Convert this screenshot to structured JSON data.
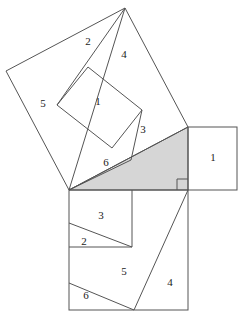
{
  "figure": {
    "kind": "pythagorean-dissection",
    "caption": "",
    "canvas": {
      "width": 249,
      "height": 322
    },
    "colors": {
      "stroke": "#555555",
      "triangle_fill": "#d6d6d6",
      "background": "#ffffff",
      "label_text": "#222222"
    },
    "triangle": {
      "name": "right-triangle",
      "vertices": {
        "left": [
          69,
          190
        ],
        "right_angle": [
          188,
          190
        ],
        "top": [
          188,
          127
        ]
      },
      "legs": {
        "horizontal": 119,
        "vertical": 63
      },
      "right_angle_marker": {
        "corner": [
          188,
          190
        ],
        "size": 11
      }
    },
    "squares": [
      {
        "name": "hypotenuse-square",
        "position": "upper-left",
        "corners": [
          [
            69,
            190
          ],
          [
            188,
            127
          ],
          [
            125,
            8
          ],
          [
            6,
            71
          ]
        ],
        "side": 134.6
      },
      {
        "name": "vertical-leg-square",
        "position": "right",
        "corners": [
          [
            188,
            127
          ],
          [
            237,
            127
          ],
          [
            237,
            190
          ],
          [
            188,
            190
          ]
        ],
        "side": 63
      },
      {
        "name": "horizontal-leg-square",
        "position": "bottom",
        "corners": [
          [
            69,
            190
          ],
          [
            188,
            190
          ],
          [
            188,
            310
          ],
          [
            69,
            310
          ]
        ],
        "side": 119
      }
    ],
    "cut_lines": {
      "hypotenuse_square": [
        {
          "name": "cut-apex-to-left-vertex",
          "from": [
            125,
            8
          ],
          "to": [
            69,
            190
          ]
        },
        {
          "name": "cut-apex-to-inner-left",
          "from": [
            125,
            8
          ],
          "to": [
            57,
            105
          ]
        },
        {
          "name": "inner-square-edge-top-left",
          "from": [
            57,
            105
          ],
          "to": [
            88,
            67
          ]
        },
        {
          "name": "inner-square-edge-top-right",
          "from": [
            88,
            67
          ],
          "to": [
            142,
            110
          ]
        },
        {
          "name": "inner-square-edge-bottom-right",
          "from": [
            142,
            110
          ],
          "to": [
            112,
            148
          ]
        },
        {
          "name": "inner-square-edge-bottom-left",
          "from": [
            112,
            148
          ],
          "to": [
            57,
            105
          ]
        },
        {
          "name": "cut-inner-right-to-edge",
          "from": [
            142,
            110
          ],
          "to": [
            131,
            160
          ]
        },
        {
          "name": "cut-left-vertex-to-piece3",
          "from": [
            69,
            190
          ],
          "to": [
            131,
            160
          ]
        }
      ],
      "horizontal_leg_square": [
        {
          "name": "cut-inner-vertical",
          "from": [
            132,
            190
          ],
          "to": [
            132,
            247
          ]
        },
        {
          "name": "cut-inner-horizontal",
          "from": [
            69,
            247
          ],
          "to": [
            132,
            247
          ]
        },
        {
          "name": "cut-piece2-diagonal",
          "from": [
            69,
            223
          ],
          "to": [
            132,
            247
          ]
        },
        {
          "name": "cut-piece5-to-bottom",
          "from": [
            188,
            190
          ],
          "to": [
            134,
            310
          ]
        },
        {
          "name": "cut-piece6-diagonal",
          "from": [
            69,
            283
          ],
          "to": [
            134,
            310
          ]
        }
      ]
    },
    "labels": [
      {
        "name": "piece-label-2-upper",
        "text": "2",
        "x": 88,
        "y": 42
      },
      {
        "name": "piece-label-4-upper",
        "text": "4",
        "x": 124,
        "y": 55
      },
      {
        "name": "piece-label-5-upper",
        "text": "5",
        "x": 43,
        "y": 104
      },
      {
        "name": "piece-label-1-upper",
        "text": "1",
        "x": 98,
        "y": 102
      },
      {
        "name": "piece-label-3-upper",
        "text": "3",
        "x": 143,
        "y": 130
      },
      {
        "name": "piece-label-6-upper",
        "text": "6",
        "x": 106,
        "y": 163
      },
      {
        "name": "piece-label-1-right",
        "text": "1",
        "x": 213,
        "y": 158
      },
      {
        "name": "piece-label-3-bottom",
        "text": "3",
        "x": 101,
        "y": 216
      },
      {
        "name": "piece-label-2-bottom",
        "text": "2",
        "x": 84,
        "y": 242
      },
      {
        "name": "piece-label-5-bottom",
        "text": "5",
        "x": 124,
        "y": 272
      },
      {
        "name": "piece-label-4-bottom",
        "text": "4",
        "x": 170,
        "y": 283
      },
      {
        "name": "piece-label-6-bottom",
        "text": "6",
        "x": 86,
        "y": 296
      }
    ]
  }
}
